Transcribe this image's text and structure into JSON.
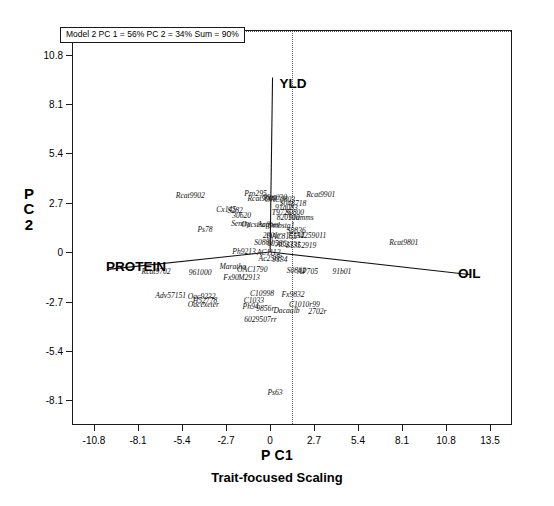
{
  "chart_data": {
    "type": "scatter",
    "title": "",
    "subtitle": "Trait-focused Scaling",
    "xlabel": "P C1",
    "ylabel_lines": [
      "P",
      "C",
      "2"
    ],
    "annotation": "Model 2 PC 1 = 56% PC 2 = 34% Sum = 90%",
    "xlim": [
      -12.15,
      14.85
    ],
    "ylim": [
      -9.45,
      12.15
    ],
    "xticks": [
      "-10.8",
      "-8.1",
      "-5.4",
      "-2.7",
      "0",
      "2.7",
      "5.4",
      "8.1",
      "10.8",
      "13.5"
    ],
    "xtick_values": [
      -10.8,
      -8.1,
      -5.4,
      -2.7,
      0,
      2.7,
      5.4,
      8.1,
      10.8,
      13.5
    ],
    "yticks": [
      "10.8",
      "8.1",
      "5.4",
      "2.7",
      "0",
      "-2.7",
      "-5.4",
      "-8.1"
    ],
    "ytick_values": [
      10.8,
      8.1,
      5.4,
      2.7,
      0,
      -2.7,
      -5.4,
      -8.1
    ],
    "grid": false,
    "legend": "none",
    "zero_lines": true,
    "trait_vectors": [
      {
        "name": "YLD",
        "x": 0.15,
        "y": 9.6,
        "label_dx": 6,
        "label_dy": -2
      },
      {
        "name": "PROTEIN",
        "x": -10.0,
        "y": -0.95,
        "label_dx": 4,
        "label_dy": -4
      },
      {
        "name": "OIL",
        "x": 12.4,
        "y": -1.25,
        "label_dx": 2,
        "label_dy": -3
      }
    ],
    "genotypes": [
      {
        "label": "Rcat9902",
        "x": -4.95,
        "y": 3.15
      },
      {
        "label": "Pro295",
        "x": -0.95,
        "y": 3.25
      },
      {
        "label": "Rcat9901",
        "x": 3.05,
        "y": 3.2
      },
      {
        "label": "Rcat9903",
        "x": -0.55,
        "y": 2.95
      },
      {
        "label": "99rt030",
        "x": 0.25,
        "y": 3.0
      },
      {
        "label": "OAC0803",
        "x": 0.55,
        "y": 2.9
      },
      {
        "label": "S048718",
        "x": 1.35,
        "y": 2.7
      },
      {
        "label": "91a083",
        "x": 0.95,
        "y": 2.45
      },
      {
        "label": "Cx145",
        "x": -2.75,
        "y": 2.35
      },
      {
        "label": "S282",
        "x": -2.2,
        "y": 2.3
      },
      {
        "label": "T9725",
        "x": 0.65,
        "y": 2.2
      },
      {
        "label": "S0800",
        "x": 1.45,
        "y": 2.2
      },
      {
        "label": "30620",
        "x": -1.8,
        "y": 2.05
      },
      {
        "label": "820100",
        "x": 1.05,
        "y": 1.95
      },
      {
        "label": "91amms",
        "x": 1.85,
        "y": 1.9
      },
      {
        "label": "Sentry",
        "x": -1.85,
        "y": 1.6
      },
      {
        "label": "Oacstraff",
        "x": -0.95,
        "y": 1.55
      },
      {
        "label": "Acanes",
        "x": -0.15,
        "y": 1.55
      },
      {
        "label": "9mbstg1",
        "x": 0.65,
        "y": 1.5
      },
      {
        "label": "Ps78",
        "x": -4.05,
        "y": 1.25
      },
      {
        "label": "S0836",
        "x": 1.55,
        "y": 1.2
      },
      {
        "label": "2901r",
        "x": 0.05,
        "y": 0.95
      },
      {
        "label": "OAC8155",
        "x": 0.65,
        "y": 0.9
      },
      {
        "label": "E132",
        "x": 1.55,
        "y": 0.95
      },
      {
        "label": "A4259011",
        "x": 2.45,
        "y": 0.95
      },
      {
        "label": "S0880",
        "x": -0.45,
        "y": 0.55
      },
      {
        "label": "00586",
        "x": 0.35,
        "y": 0.5
      },
      {
        "label": "AC2331",
        "x": 1.05,
        "y": 0.45
      },
      {
        "label": "S1352919",
        "x": 1.85,
        "y": 0.4
      },
      {
        "label": "Ph9213",
        "x": -1.65,
        "y": 0.05
      },
      {
        "label": "AC1112",
        "x": -0.15,
        "y": 0.0
      },
      {
        "label": "Ac2588",
        "x": -0.05,
        "y": -0.3
      },
      {
        "label": "9134",
        "x": 0.55,
        "y": -0.35
      },
      {
        "label": "Rcat9702",
        "x": -7.05,
        "y": -1.05
      },
      {
        "label": "961000",
        "x": -4.35,
        "y": -1.1
      },
      {
        "label": "Maratha",
        "x": -2.35,
        "y": -0.75
      },
      {
        "label": "OAC1790",
        "x": -1.15,
        "y": -0.9
      },
      {
        "label": "S0802",
        "x": 1.55,
        "y": -0.95
      },
      {
        "label": "AP705",
        "x": 2.25,
        "y": -1.05
      },
      {
        "label": "91b01",
        "x": 4.35,
        "y": -1.05
      },
      {
        "label": "Fx90",
        "x": -2.45,
        "y": -1.35
      },
      {
        "label": "M2913",
        "x": -1.35,
        "y": -1.35
      },
      {
        "label": "Rcat9801",
        "x": 8.15,
        "y": 0.55
      },
      {
        "label": "Adv57151",
        "x": -6.15,
        "y": -2.35
      },
      {
        "label": "Oac9232",
        "x": -4.25,
        "y": -2.4
      },
      {
        "label": "H52778",
        "x": -4.05,
        "y": -2.6
      },
      {
        "label": "Oacexeter",
        "x": -4.15,
        "y": -2.85
      },
      {
        "label": "C10998",
        "x": -0.55,
        "y": -2.25
      },
      {
        "label": "Fx9832",
        "x": 1.35,
        "y": -2.3
      },
      {
        "label": "C1033",
        "x": -1.05,
        "y": -2.6
      },
      {
        "label": "Ph94",
        "x": -1.25,
        "y": -2.95
      },
      {
        "label": "9856r",
        "x": -0.35,
        "y": -3.05
      },
      {
        "label": "Dacaalb",
        "x": 0.95,
        "y": -3.15
      },
      {
        "label": "C1010r99",
        "x": 2.05,
        "y": -2.85
      },
      {
        "label": "2702r",
        "x": 2.85,
        "y": -3.2
      },
      {
        "label": "6029507rr",
        "x": -0.65,
        "y": -3.65
      },
      {
        "label": "Ps63",
        "x": 0.25,
        "y": -7.65
      }
    ]
  }
}
